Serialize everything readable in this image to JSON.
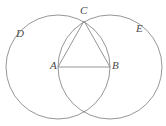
{
  "figure": {
    "background_color": "#ffffff",
    "stroke_color": "#8a8a8a",
    "label_color": "#4a4a4a",
    "labels": {
      "A": "A",
      "B": "B",
      "C": "C",
      "D": "D",
      "E": "E"
    },
    "points": {
      "A": {
        "x": 58,
        "y": 67
      },
      "B": {
        "x": 110,
        "y": 67
      },
      "C": {
        "x": 84,
        "y": 21
      },
      "lower_intersection": {
        "x": 84,
        "y": 112
      }
    },
    "circles": [
      {
        "name": "left-circle",
        "cx": 58,
        "cy": 67,
        "r": 52
      },
      {
        "name": "right-circle",
        "cx": 110,
        "cy": 67,
        "r": 52
      }
    ],
    "segments": [
      {
        "name": "segment-AB",
        "x1": 58,
        "y1": 67,
        "x2": 110,
        "y2": 67
      },
      {
        "name": "segment-AC",
        "x1": 58,
        "y1": 67,
        "x2": 84,
        "y2": 21
      },
      {
        "name": "segment-BC",
        "x1": 110,
        "y1": 67,
        "x2": 84,
        "y2": 21
      }
    ]
  }
}
